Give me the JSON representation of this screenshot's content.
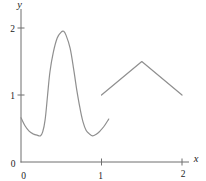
{
  "figure": {
    "background_color": "#ffffff",
    "axis_color": "#6e6e6e",
    "curve_color": "#8f8f8f",
    "label_color": "#1c1c1c",
    "x_axis_label": "x",
    "y_axis_label": "y",
    "x_tick_labels": [
      "0",
      "1",
      "2"
    ],
    "y_tick_labels": [
      "0",
      "1",
      "2"
    ]
  },
  "chart_data": {
    "type": "line",
    "title": "",
    "xlabel": "x",
    "ylabel": "y",
    "xlim": [
      0,
      2.1
    ],
    "ylim": [
      0,
      2.3
    ],
    "grid": false,
    "legend": false,
    "x_ticks": [
      0,
      1,
      2
    ],
    "y_ticks": [
      0,
      1,
      2
    ],
    "series": [
      {
        "name": "narrow-peak-curve",
        "interpolation": "smooth",
        "x": [
          0.0,
          0.05,
          0.1,
          0.15,
          0.2,
          0.24,
          0.27,
          0.3,
          0.33,
          0.36,
          0.4,
          0.45,
          0.5,
          0.53,
          0.56,
          0.61,
          0.65,
          0.69,
          0.73,
          0.77,
          0.81,
          0.85,
          0.89,
          0.93,
          0.98,
          1.03,
          1.09
        ],
        "y": [
          0.66,
          0.54,
          0.46,
          0.42,
          0.4,
          0.39,
          0.45,
          0.63,
          1.0,
          1.35,
          1.63,
          1.85,
          1.94,
          1.95,
          1.89,
          1.7,
          1.42,
          1.1,
          0.82,
          0.6,
          0.47,
          0.42,
          0.39,
          0.41,
          0.46,
          0.53,
          0.64
        ]
      },
      {
        "name": "triangle-segment",
        "interpolation": "linear",
        "x": [
          1.0,
          1.5,
          2.0
        ],
        "y": [
          1.0,
          1.5,
          1.0
        ]
      }
    ]
  }
}
